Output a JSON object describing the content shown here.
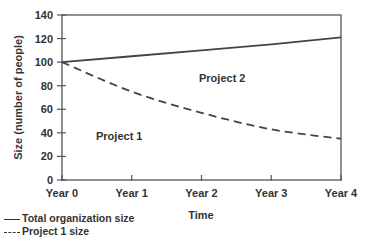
{
  "chart_data": {
    "type": "line",
    "title": "",
    "xlabel": "Time",
    "ylabel": "Size (number of people)",
    "categories": [
      "Year 0",
      "Year 1",
      "Year 2",
      "Year 3",
      "Year 4"
    ],
    "ylim": [
      0,
      140
    ],
    "yticks": [
      0,
      20,
      40,
      60,
      80,
      100,
      120,
      140
    ],
    "grid": false,
    "series": [
      {
        "name": "Total organization size",
        "style": "solid",
        "values": [
          100,
          105,
          110,
          115,
          121
        ]
      },
      {
        "name": "Project 1 size",
        "style": "dashed",
        "values": [
          100,
          75,
          57,
          43,
          35
        ]
      }
    ],
    "annotations": [
      {
        "text": "Project 1",
        "x": "between Year 0 and Year 1",
        "y": 38
      },
      {
        "text": "Project 2",
        "x": "Year 2.4",
        "y": 84
      }
    ],
    "legend_position": "bottom-left"
  },
  "labels": {
    "xlabel": "Time",
    "ylabel": "Size (number of people)",
    "project1": "Project 1",
    "project2": "Project 2",
    "legend_total": "Total organization size",
    "legend_p1": "Project 1 size"
  }
}
